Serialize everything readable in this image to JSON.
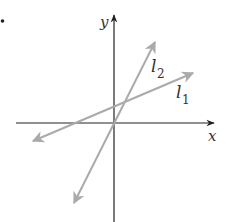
{
  "diagram": {
    "type": "coordinate-plane",
    "axes": {
      "x_label": "x",
      "y_label": "y",
      "color": "#222222"
    },
    "lines": [
      {
        "name": "l1",
        "label_base": "l",
        "label_sub": "1",
        "color": "#aaaaaa",
        "description": "shallow positive slope, positive y-intercept"
      },
      {
        "name": "l2",
        "label_base": "l",
        "label_sub": "2",
        "color": "#aaaaaa",
        "description": "steep positive slope, near-origin y-intercept"
      }
    ],
    "bullet": "•"
  }
}
